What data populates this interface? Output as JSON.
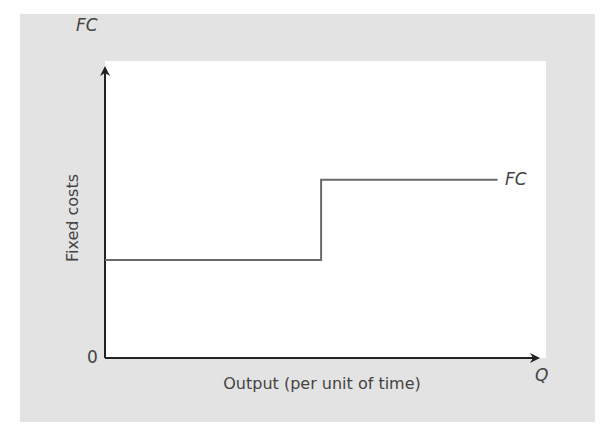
{
  "chart_data": {
    "type": "line",
    "subtype": "step",
    "title": "",
    "xlabel": "Output (per unit of time)",
    "ylabel": "Fixed costs",
    "x_axis_symbol": "Q",
    "y_axis_symbol": "FC",
    "origin_label": "0",
    "series": [
      {
        "name": "FC",
        "points": [
          {
            "x": 0.0,
            "y": 0.33
          },
          {
            "x": 0.49,
            "y": 0.33
          },
          {
            "x": 0.49,
            "y": 0.6
          },
          {
            "x": 0.89,
            "y": 0.6
          }
        ],
        "line_color": "#6a6a6a",
        "end_label": "FC"
      }
    ],
    "xlim": [
      0,
      1
    ],
    "ylim": [
      0,
      1
    ],
    "grid": false,
    "legend": "none",
    "tick_labels": false
  },
  "labels": {
    "y_symbol": "FC",
    "x_symbol": "Q",
    "origin": "0",
    "series_end": "FC",
    "y_title": "Fixed costs",
    "x_title": "Output (per unit of time)"
  },
  "colors": {
    "panel_background": "#e3e3e3",
    "plot_background": "#ffffff",
    "axis": "#222222",
    "series_line": "#6a6a6a",
    "text": "#444444"
  }
}
